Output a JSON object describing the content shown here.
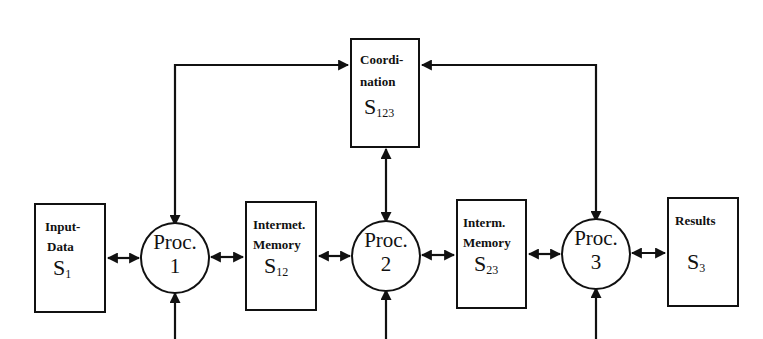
{
  "diagram": {
    "coordination": {
      "line1": "Coordi-",
      "line2": "nation",
      "symbol": "S",
      "sub": "123"
    },
    "input": {
      "line1": "Input-",
      "line2": "Data",
      "symbol": "S",
      "sub": "1"
    },
    "mem12": {
      "line1": "Intermet.",
      "line2": "Memory",
      "symbol": "S",
      "sub": "12"
    },
    "mem23": {
      "line1": "Interm.",
      "line2": "Memory",
      "symbol": "S",
      "sub": "23"
    },
    "results": {
      "line1": "Results",
      "symbol": "S",
      "sub": "3"
    },
    "processors": [
      {
        "label": "Proc.",
        "number": "1"
      },
      {
        "label": "Proc.",
        "number": "2"
      },
      {
        "label": "Proc.",
        "number": "3"
      }
    ],
    "programs": [
      {
        "line1": "Pro-",
        "line2": "gram",
        "symbol": "P",
        "sub": "1"
      },
      {
        "line1": "Pro-",
        "line2": "gram",
        "symbol": "P",
        "sub": "2"
      },
      {
        "line1": "Pro-",
        "line2": "gram",
        "symbol": "P",
        "sub": "3"
      }
    ]
  }
}
